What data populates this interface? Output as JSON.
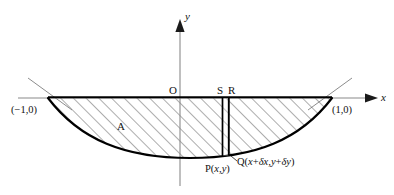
{
  "figure": {
    "background_color": "#ffffff",
    "ink_color": "#111111",
    "axis_color": "#8a8a8a",
    "curve_color": "#000000",
    "hatch_color": "#4a4a4a"
  },
  "axes": {
    "x_axis_label": "x",
    "y_axis_label": "y",
    "origin_label": "O"
  },
  "labels": {
    "left_intercept": "(−1,0)",
    "right_intercept": "(1,0)",
    "region": "A",
    "strip_left_top": "S",
    "strip_right_top": "R",
    "point_p": "P(x,y)",
    "point_q": "Q(x+δx,y+δy)"
  },
  "chart_data": {
    "type": "line",
    "xlabel": "x",
    "ylabel": "y",
    "xlim": [
      -1.35,
      1.35
    ],
    "ylim": [
      -1.25,
      0.55
    ],
    "grid": false,
    "legend": null,
    "curve": {
      "name": "y = x^2 - 1",
      "equation": "y = x² − 1",
      "x_intercepts": [
        -1,
        1
      ],
      "vertex": [
        0,
        -1
      ],
      "x": [
        -1.0,
        -0.8,
        -0.6,
        -0.4,
        -0.2,
        0.0,
        0.2,
        0.4,
        0.6,
        0.8,
        1.0
      ],
      "y": [
        0.0,
        -0.36,
        -0.64,
        -0.84,
        -0.96,
        -1.0,
        -0.96,
        -0.84,
        -0.64,
        -0.36,
        0.0
      ]
    },
    "shaded_region": {
      "label": "A",
      "description": "region between the curve and the x-axis from x=-1 to x=1",
      "fill": "diagonal-hatch"
    },
    "strip": {
      "description": "elemental vertical strip PSRQ of width δx",
      "left_x": 0.31,
      "right_x": 0.38,
      "top_y": 0.0,
      "points": {
        "S": [
          0.31,
          0.0
        ],
        "R": [
          0.38,
          0.0
        ],
        "P": [
          0.31,
          -0.9
        ],
        "Q": [
          0.38,
          -0.86
        ]
      }
    },
    "tangent_hints": [
      {
        "description": "short line through (-1,0)"
      },
      {
        "description": "short line through (1,0)"
      }
    ]
  }
}
